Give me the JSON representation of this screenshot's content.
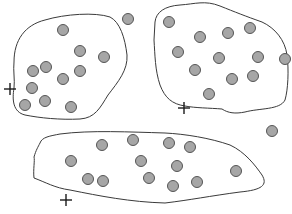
{
  "diagram": {
    "colors": {
      "background": "#ffffff",
      "point_fill": "#a6a6a6",
      "point_stroke": "#555555",
      "boundary": "#3a3a3a",
      "cross": "#1a1a1a"
    },
    "point_radius": 5.5,
    "clusters": [
      {
        "name": "top-left",
        "boundary_path": "M14,62 C14,40 25,25 45,20 C65,14 95,12 110,17 C120,22 125,38 127,55 C128,70 118,82 108,95 C100,108 95,118 80,119 C60,120 40,118 25,115 C13,112 12,100 14,88 C15,80 13,70 14,62 Z",
        "points": [
          [
            63,
            30
          ],
          [
            80,
            51
          ],
          [
            104,
            57
          ],
          [
            46,
            67
          ],
          [
            33,
            71
          ],
          [
            80,
            71
          ],
          [
            63,
            79
          ],
          [
            32,
            88
          ],
          [
            25,
            105
          ],
          [
            45,
            101
          ],
          [
            71,
            107
          ]
        ]
      },
      {
        "name": "top-right",
        "boundary_path": "M155,22 C156,12 165,6 180,5 C195,4 205,0 220,6 C235,12 245,16 262,22 C275,28 285,40 287,55 C289,70 288,90 285,100 C280,110 260,108 245,112 C235,114 228,113 222,109 C210,108 195,108 185,106 C172,104 165,98 160,85 C155,70 155,55 154,40 Z",
        "points": [
          [
            169,
            22
          ],
          [
            200,
            37
          ],
          [
            228,
            33
          ],
          [
            250,
            28
          ],
          [
            178,
            52
          ],
          [
            219,
            58
          ],
          [
            258,
            57
          ],
          [
            285,
            59
          ],
          [
            195,
            70
          ],
          [
            232,
            79
          ],
          [
            253,
            76
          ],
          [
            209,
            94
          ]
        ]
      },
      {
        "name": "bottom",
        "boundary_path": "M40,143 C42,137 50,136 60,134 C90,130 130,132 165,133 C185,134 210,138 230,145 C245,152 255,165 262,175 C268,185 262,190 240,192 C210,196 190,200 165,203 C130,202 100,196 70,190 C55,188 45,182 34,178 C33,170 35,160 34,157 C36,150 38,147 40,143 Z",
        "points": [
          [
            102,
            145
          ],
          [
            133,
            140
          ],
          [
            169,
            143
          ],
          [
            190,
            147
          ],
          [
            71,
            161
          ],
          [
            141,
            161
          ],
          [
            177,
            166
          ],
          [
            236,
            171
          ],
          [
            88,
            179
          ],
          [
            103,
            181
          ],
          [
            149,
            178
          ],
          [
            173,
            186
          ],
          [
            197,
            182
          ]
        ]
      }
    ],
    "outliers": [
      [
        128,
        19
      ],
      [
        272,
        131
      ]
    ],
    "crosses": [
      [
        10,
        89
      ],
      [
        184,
        108
      ],
      [
        66,
        200
      ]
    ],
    "cross_size": 6
  }
}
